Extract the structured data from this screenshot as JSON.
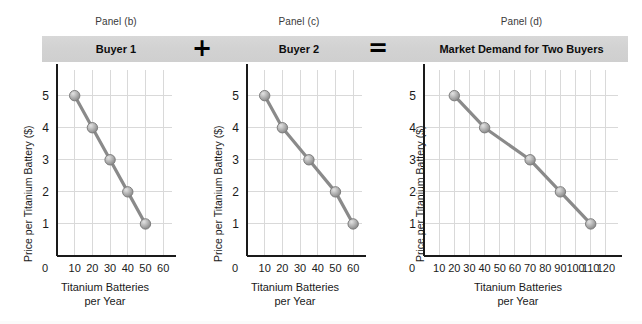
{
  "figure": {
    "background_color": "#ffffff",
    "band_color": "#d3d3d3",
    "series_color": "#8a8a8a",
    "marker_color": "#a6a6a6",
    "grid_color": "#d9d9d9",
    "axis_color": "#1a1a1a"
  },
  "header": {
    "captions": [
      {
        "label": "Panel (b)"
      },
      {
        "label": "Panel (c)"
      },
      {
        "label": "Panel (d)"
      }
    ],
    "titles": [
      {
        "label": "Buyer 1"
      },
      {
        "label": "Buyer 2"
      },
      {
        "label": "Market Demand for Two Buyers"
      }
    ],
    "operators": [
      {
        "label": "+",
        "name": "plus-icon"
      },
      {
        "label": "=",
        "name": "equals-icon"
      }
    ]
  },
  "axis_titles": {
    "y": "Price per Titanium Battery ($)",
    "x_line1": "Titanium Batteries",
    "x_line2": "per Year"
  },
  "chart_data": [
    {
      "type": "line",
      "title": "Buyer 1",
      "panel": "Panel (b)",
      "xlabel": "Titanium Batteries per Year",
      "ylabel": "Price per Titanium Battery ($)",
      "xlim": [
        0,
        65
      ],
      "ylim": [
        0,
        5.8
      ],
      "xticks": [
        0,
        10,
        20,
        30,
        40,
        50,
        60
      ],
      "yticks": [
        1,
        2,
        3,
        4,
        5
      ],
      "grid": true,
      "legend": "none",
      "x": [
        10,
        20,
        30,
        40,
        50
      ],
      "y": [
        5,
        4,
        3,
        2,
        1
      ]
    },
    {
      "type": "line",
      "title": "Buyer 2",
      "panel": "Panel (c)",
      "xlabel": "Titanium Batteries per Year",
      "ylabel": "Price per Titanium Battery ($)",
      "xlim": [
        0,
        65
      ],
      "ylim": [
        0,
        5.8
      ],
      "xticks": [
        0,
        10,
        20,
        30,
        40,
        50,
        60
      ],
      "yticks": [
        1,
        2,
        3,
        4,
        5
      ],
      "grid": true,
      "legend": "none",
      "x": [
        10,
        20,
        35,
        50,
        60
      ],
      "y": [
        5,
        4,
        3,
        2,
        1
      ]
    },
    {
      "type": "line",
      "title": "Market Demand for Two Buyers",
      "panel": "Panel (d)",
      "xlabel": "Titanium Batteries per Year",
      "ylabel": "Price per Titanium Battery ($)",
      "xlim": [
        0,
        128
      ],
      "ylim": [
        0,
        5.8
      ],
      "xticks": [
        0,
        10,
        20,
        30,
        40,
        50,
        60,
        70,
        80,
        90,
        100,
        110,
        120
      ],
      "yticks": [
        1,
        2,
        3,
        4,
        5
      ],
      "grid": true,
      "legend": "none",
      "x": [
        20,
        40,
        70,
        90,
        110
      ],
      "y": [
        5,
        4,
        3,
        2,
        1
      ]
    }
  ]
}
